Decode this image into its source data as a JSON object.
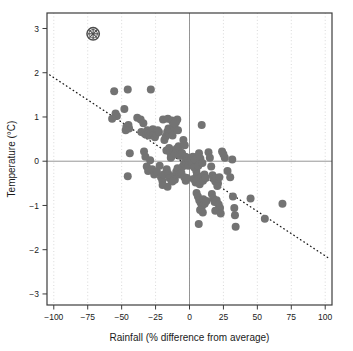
{
  "chart_data": {
    "type": "scatter",
    "title": "",
    "xlabel": "Rainfall (% difference from average)",
    "ylabel": "Temperature (°C)",
    "xlim": [
      -105,
      105
    ],
    "ylim": [
      -3.25,
      3.35
    ],
    "xticks": [
      -100,
      -75,
      -50,
      -25,
      0,
      25,
      50,
      75,
      100
    ],
    "xtick_labels": [
      "−100",
      "−75",
      "−50",
      "−25",
      "0",
      "25",
      "50",
      "75",
      "100"
    ],
    "yticks": [
      3,
      2,
      1,
      0,
      -1,
      -2,
      -3
    ],
    "ytick_labels": [
      "3",
      "2",
      "1",
      "0",
      "−1",
      "−2",
      "−3"
    ],
    "grid": "dotted vertical gridlines at x ticks",
    "legend": "none",
    "reference_lines": [
      {
        "name": "zero-temperature-line",
        "orientation": "horizontal",
        "value": 0,
        "color": "#8a8a8a"
      },
      {
        "name": "zero-rainfall-line",
        "orientation": "vertical",
        "value": 0,
        "color": "#8a8a8a"
      }
    ],
    "trend_line": {
      "name": "regression-trend-line",
      "style": "dotted",
      "color": "#1a1a1a",
      "x_start": -103,
      "y_start": 1.95,
      "x_end": 103,
      "y_end": -2.2
    },
    "highlight_marker": {
      "name": "circled-asterisk-marker",
      "x": -71,
      "y": 2.88,
      "symbol": "circled-asterisk",
      "color": "#4d4d4d"
    },
    "point_color": "#737373",
    "point_size": 5.2,
    "points": [
      [
        -55.5,
        1.58
      ],
      [
        -45.5,
        1.62
      ],
      [
        -28.5,
        1.62
      ],
      [
        -48.0,
        1.18
      ],
      [
        -54.5,
        1.08
      ],
      [
        -53.5,
        1.02
      ],
      [
        -57.0,
        0.96
      ],
      [
        -45.0,
        0.82
      ],
      [
        -46.5,
        0.78
      ],
      [
        -44.5,
        0.74
      ],
      [
        -47.0,
        0.7
      ],
      [
        -44.0,
        0.18
      ],
      [
        -45.5,
        -0.34
      ],
      [
        -38.5,
        0.98
      ],
      [
        -36.0,
        0.94
      ],
      [
        -34.0,
        0.86
      ],
      [
        -35.5,
        0.66
      ],
      [
        -33.0,
        0.62
      ],
      [
        -32.0,
        0.6
      ],
      [
        -31.0,
        0.7
      ],
      [
        -30.0,
        0.64
      ],
      [
        -29.5,
        0.58
      ],
      [
        -28.0,
        0.66
      ],
      [
        -27.0,
        0.72
      ],
      [
        -26.5,
        0.6
      ],
      [
        -25.5,
        0.54
      ],
      [
        -24.5,
        0.62
      ],
      [
        -23.5,
        0.7
      ],
      [
        -22.5,
        0.66
      ],
      [
        -33.5,
        0.22
      ],
      [
        -32.5,
        0.1
      ],
      [
        -31.5,
        -0.12
      ],
      [
        -30.5,
        -0.22
      ],
      [
        -29.0,
        0.02
      ],
      [
        -27.5,
        -0.18
      ],
      [
        -26.0,
        -0.3
      ],
      [
        -24.0,
        -0.24
      ],
      [
        -22.0,
        -0.1
      ],
      [
        -21.0,
        -0.36
      ],
      [
        -20.0,
        -0.44
      ],
      [
        -19.0,
        -0.3
      ],
      [
        -18.5,
        0.48
      ],
      [
        -17.5,
        0.56
      ],
      [
        -16.5,
        0.66
      ],
      [
        -15.5,
        0.74
      ],
      [
        -14.5,
        0.62
      ],
      [
        -13.5,
        0.7
      ],
      [
        -12.5,
        0.58
      ],
      [
        -12.0,
        0.82
      ],
      [
        -11.0,
        0.76
      ],
      [
        -10.0,
        0.88
      ],
      [
        -9.0,
        0.94
      ],
      [
        -8.5,
        0.7
      ],
      [
        -19.5,
        0.94
      ],
      [
        -16.0,
        0.96
      ],
      [
        -13.0,
        0.92
      ],
      [
        -11.5,
        0.86
      ],
      [
        -17.0,
        0.24
      ],
      [
        -15.0,
        0.3
      ],
      [
        -14.0,
        0.18
      ],
      [
        -13.8,
        0.08
      ],
      [
        -12.8,
        0.12
      ],
      [
        -11.8,
        0.22
      ],
      [
        -10.5,
        0.16
      ],
      [
        -9.5,
        0.28
      ],
      [
        -8.0,
        0.34
      ],
      [
        -7.0,
        0.22
      ],
      [
        -6.5,
        0.12
      ],
      [
        -5.5,
        0.18
      ],
      [
        -16.8,
        -0.18
      ],
      [
        -15.8,
        -0.28
      ],
      [
        -14.8,
        -0.38
      ],
      [
        -13.2,
        -0.44
      ],
      [
        -12.2,
        -0.34
      ],
      [
        -10.8,
        -0.42
      ],
      [
        -9.8,
        -0.24
      ],
      [
        -8.8,
        -0.16
      ],
      [
        -7.5,
        -0.3
      ],
      [
        -6.0,
        -0.26
      ],
      [
        -5.0,
        -0.12
      ],
      [
        -4.0,
        -0.06
      ],
      [
        -19.8,
        -0.54
      ],
      [
        -16.2,
        -0.58
      ],
      [
        -12.6,
        -0.46
      ],
      [
        -4.5,
        0.48
      ],
      [
        -3.5,
        0.36
      ],
      [
        -3.0,
        0.1
      ],
      [
        -2.5,
        0.04
      ],
      [
        -2.0,
        -0.04
      ],
      [
        -1.5,
        0.08
      ],
      [
        -1.0,
        -0.1
      ],
      [
        -0.5,
        0.02
      ],
      [
        -3.8,
        -0.36
      ],
      [
        -2.8,
        -0.44
      ],
      [
        -1.8,
        -0.38
      ],
      [
        1.0,
        0.02
      ],
      [
        2.0,
        -0.06
      ],
      [
        2.5,
        0.1
      ],
      [
        3.5,
        -0.14
      ],
      [
        4.0,
        0.04
      ],
      [
        5.0,
        -0.22
      ],
      [
        5.5,
        -0.3
      ],
      [
        6.5,
        -0.1
      ],
      [
        7.0,
        0.18
      ],
      [
        8.0,
        0.06
      ],
      [
        9.0,
        0.82
      ],
      [
        9.5,
        -0.04
      ],
      [
        3.0,
        -0.4
      ],
      [
        4.5,
        -0.48
      ],
      [
        6.0,
        -0.42
      ],
      [
        7.5,
        -0.52
      ],
      [
        8.5,
        -0.36
      ],
      [
        10.0,
        -0.44
      ],
      [
        11.0,
        -0.3
      ],
      [
        12.0,
        -0.38
      ],
      [
        5.2,
        -0.72
      ],
      [
        6.2,
        -0.8
      ],
      [
        7.2,
        -0.88
      ],
      [
        8.2,
        -0.94
      ],
      [
        9.2,
        -1.02
      ],
      [
        10.2,
        -0.86
      ],
      [
        11.2,
        -0.96
      ],
      [
        12.5,
        -0.9
      ],
      [
        7.8,
        -1.1
      ],
      [
        9.8,
        -1.16
      ],
      [
        6.8,
        -1.42
      ],
      [
        14.0,
        0.2
      ],
      [
        15.0,
        0.08
      ],
      [
        16.0,
        -0.12
      ],
      [
        17.0,
        -0.32
      ],
      [
        18.0,
        -0.4
      ],
      [
        19.0,
        -0.46
      ],
      [
        20.0,
        -0.42
      ],
      [
        21.0,
        -0.5
      ],
      [
        19.5,
        -0.38
      ],
      [
        20.5,
        -0.56
      ],
      [
        22.0,
        -0.36
      ],
      [
        16.5,
        -0.74
      ],
      [
        17.5,
        -0.84
      ],
      [
        18.5,
        -0.92
      ],
      [
        20.0,
        -0.88
      ],
      [
        21.5,
        -0.98
      ],
      [
        22.5,
        -1.06
      ],
      [
        19.0,
        -1.12
      ],
      [
        23.0,
        -1.18
      ],
      [
        24.0,
        0.22
      ],
      [
        26.0,
        0.08
      ],
      [
        25.0,
        0.16
      ],
      [
        28.0,
        -0.22
      ],
      [
        30.0,
        -0.36
      ],
      [
        31.5,
        0.04
      ],
      [
        32.0,
        -0.8
      ],
      [
        33.0,
        -1.06
      ],
      [
        34.0,
        -1.48
      ],
      [
        33.5,
        -1.22
      ],
      [
        45.0,
        -0.84
      ],
      [
        55.5,
        -1.3
      ],
      [
        68.5,
        -0.96
      ]
    ]
  }
}
